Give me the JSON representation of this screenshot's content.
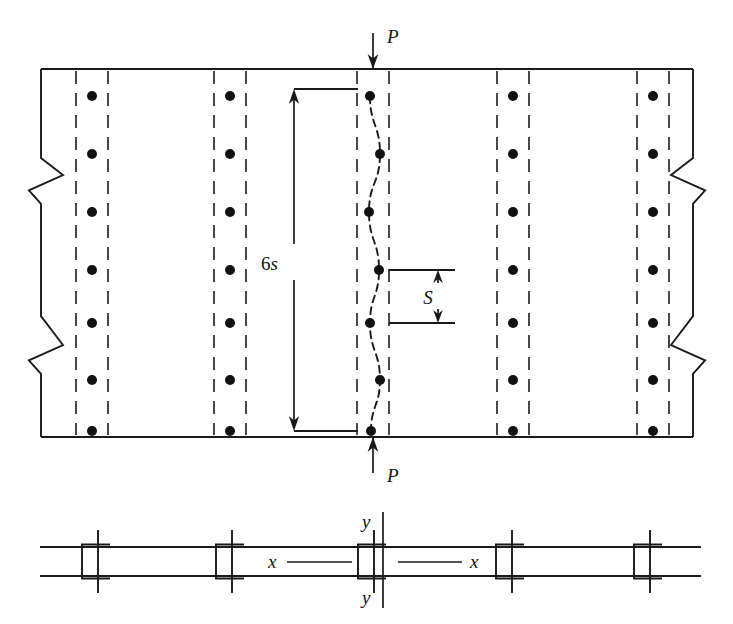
{
  "figure": {
    "type": "engineering-diagram",
    "canvas": {
      "width": 733,
      "height": 624
    },
    "background_color": "#ffffff",
    "line_color": "#1a1a1a"
  },
  "labels": {
    "load_top": "P",
    "load_bottom": "P",
    "length_dimension": "6s",
    "spacing_dimension": "S",
    "axis_x_left": "x",
    "axis_x_right": "x",
    "axis_y_top": "y",
    "axis_y_bottom": "y"
  },
  "plan_view": {
    "plate": {
      "x": 41,
      "y": 69,
      "width": 652,
      "height": 368
    },
    "rivet_columns": [
      {
        "name": "column-1",
        "center_x": 92,
        "dash_left_x": 76,
        "dash_right_x": 108
      },
      {
        "name": "column-2",
        "center_x": 230,
        "dash_left_x": 214,
        "dash_right_x": 246
      },
      {
        "name": "column-3",
        "center_x": 373,
        "dash_left_x": 357,
        "dash_right_x": 389
      },
      {
        "name": "column-4",
        "center_x": 513,
        "dash_left_x": 497,
        "dash_right_x": 529
      },
      {
        "name": "column-5",
        "center_x": 653,
        "dash_left_x": 637,
        "dash_right_x": 669
      }
    ],
    "rivet_rows_y": [
      96,
      154,
      212,
      270,
      323,
      380,
      431
    ],
    "rivet_radius": 5.0,
    "buckled_column_index": 2,
    "buckle_offsets": [
      -3,
      7,
      -4,
      6,
      -3,
      7,
      -2
    ],
    "break_lines": {
      "left_x": 41,
      "right_x": 693,
      "upper_y": 175,
      "lower_y": 345,
      "amplitude": 22
    }
  },
  "load_arrows": {
    "top": {
      "x": 373,
      "y_start": 33,
      "y_end": 69,
      "direction": "down",
      "label_x": 387,
      "label_y": 43
    },
    "bottom": {
      "x": 373,
      "y_start": 473,
      "y_end": 437,
      "direction": "up",
      "label_x": 387,
      "label_y": 482
    }
  },
  "dimensions": {
    "overall": {
      "name": "6s",
      "line_x": 294,
      "y_top": 89,
      "y_bottom": 431,
      "ext_top": {
        "x1": 294,
        "x2": 358,
        "y": 89
      },
      "ext_bottom": {
        "x1": 294,
        "x2": 358,
        "y": 431
      },
      "label_x": 278,
      "label_y": 270
    },
    "pitch": {
      "name": "S",
      "line_x": 438,
      "y_top": 270,
      "y_bottom": 323,
      "ext_top": {
        "x1": 389,
        "x2": 455,
        "y": 270
      },
      "ext_bottom": {
        "x1": 389,
        "x2": 455,
        "y": 323
      },
      "label_x": 428,
      "label_y": 304
    }
  },
  "section_view": {
    "plate_top_y": 547,
    "plate_bottom_y": 576,
    "plate_x_start": 41,
    "plate_x_end": 700,
    "channels": [
      {
        "name": "channel-1",
        "x": 98
      },
      {
        "name": "channel-2",
        "x": 232
      },
      {
        "name": "channel-3",
        "x": 374
      },
      {
        "name": "channel-4",
        "x": 512
      },
      {
        "name": "channel-5",
        "x": 650
      }
    ],
    "channel_shape": {
      "half_width": 16,
      "half_height": 17,
      "tick_extend": 12
    },
    "y_axis": {
      "x": 383,
      "y_top": 512,
      "y_bottom": 608
    },
    "y_label_top": {
      "x": 362,
      "y": 528
    },
    "y_label_bottom": {
      "x": 362,
      "y": 604
    },
    "x_leader_left": {
      "x1": 287,
      "x2": 352,
      "y": 562
    },
    "x_leader_right": {
      "x1": 398,
      "x2": 462,
      "y": 562
    },
    "x_label_left": {
      "x": 268,
      "y": 568
    },
    "x_label_right": {
      "x": 470,
      "y": 568
    }
  }
}
